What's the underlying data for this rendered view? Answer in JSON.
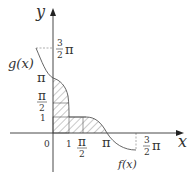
{
  "diagram": {
    "axes": {
      "x_label": "x",
      "y_label": "y",
      "origin_label": "0"
    },
    "x_ticks": [
      {
        "label": "1"
      },
      {
        "label_num": "π",
        "label_den": "2"
      },
      {
        "label": "π"
      },
      {
        "label_num": "3",
        "label_den": "2",
        "suffix": "π"
      }
    ],
    "y_ticks": [
      {
        "label": "1"
      },
      {
        "label_num": "π",
        "label_den": "2"
      },
      {
        "label": "π"
      },
      {
        "label_num": "3",
        "label_den": "2",
        "suffix": "π"
      }
    ],
    "curves": [
      {
        "name": "g(x)",
        "label": "g(x)"
      },
      {
        "name": "f(x)",
        "label": "f(x)"
      }
    ],
    "colors": {
      "axis": "#333333",
      "curve": "#555555",
      "hatch": "#777777"
    }
  }
}
